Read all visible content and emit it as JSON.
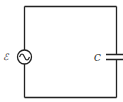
{
  "diagram": {
    "type": "circuit",
    "components": [
      {
        "id": "source",
        "kind": "ac-voltage-source",
        "label": "ℰ"
      },
      {
        "id": "capacitor",
        "kind": "capacitor",
        "label": "C"
      }
    ],
    "colors": {
      "wire": "#222222",
      "background": "#ffffff"
    }
  }
}
